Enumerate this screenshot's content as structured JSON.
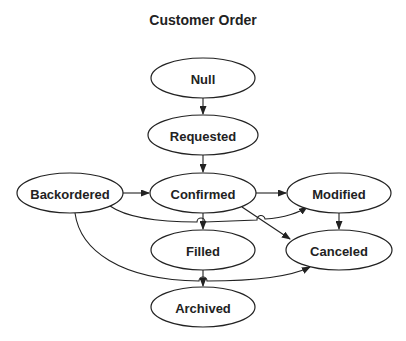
{
  "title": "Customer Order",
  "nodes": [
    {
      "id": "null",
      "label": "Null",
      "cx": 203,
      "cy": 78,
      "rx": 52,
      "ry": 20
    },
    {
      "id": "requested",
      "label": "Requested",
      "cx": 203,
      "cy": 135,
      "rx": 55,
      "ry": 20
    },
    {
      "id": "confirmed",
      "label": "Confirmed",
      "cx": 203,
      "cy": 193,
      "rx": 53,
      "ry": 20
    },
    {
      "id": "backordered",
      "label": "Backordered",
      "cx": 70,
      "cy": 193,
      "rx": 53,
      "ry": 20
    },
    {
      "id": "modified",
      "label": "Modified",
      "cx": 339,
      "cy": 193,
      "rx": 52,
      "ry": 20
    },
    {
      "id": "filled",
      "label": "Filled",
      "cx": 203,
      "cy": 250,
      "rx": 52,
      "ry": 20
    },
    {
      "id": "canceled",
      "label": "Canceled",
      "cx": 339,
      "cy": 250,
      "rx": 53,
      "ry": 20
    },
    {
      "id": "archived",
      "label": "Archived",
      "cx": 203,
      "cy": 307,
      "rx": 52,
      "ry": 20
    }
  ],
  "edges": [
    {
      "from": "null",
      "to": "requested"
    },
    {
      "from": "requested",
      "to": "confirmed"
    },
    {
      "from": "backordered",
      "to": "confirmed"
    },
    {
      "from": "confirmed",
      "to": "modified"
    },
    {
      "from": "backordered",
      "to": "modified"
    },
    {
      "from": "confirmed",
      "to": "filled"
    },
    {
      "from": "confirmed",
      "to": "canceled"
    },
    {
      "from": "modified",
      "to": "canceled"
    },
    {
      "from": "backordered",
      "to": "canceled"
    },
    {
      "from": "filled",
      "to": "archived"
    }
  ]
}
